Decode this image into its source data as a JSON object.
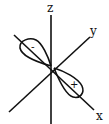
{
  "diagram": {
    "type": "orbital-diagram",
    "axes": [
      {
        "name": "z",
        "label": "z"
      },
      {
        "name": "y",
        "label": "y"
      },
      {
        "name": "x",
        "label": "x"
      }
    ],
    "lobes": [
      {
        "name": "negative-lobe",
        "sign": "-",
        "direction": "-x"
      },
      {
        "name": "positive-lobe",
        "sign": "+",
        "direction": "+x"
      }
    ],
    "colors": {
      "stroke": "#111111",
      "background": "#ffffff"
    }
  }
}
